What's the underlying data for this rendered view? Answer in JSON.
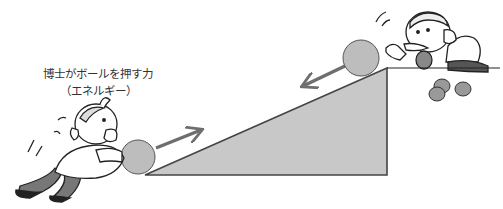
{
  "caption": {
    "line1": "博士がボールを押す力",
    "line2": "（エネルギー）"
  },
  "figure": {
    "slope": {
      "points": "145,175 387,68 387,175",
      "fill": "#c8c8c8",
      "stroke": "#444444"
    },
    "balls": [
      {
        "id": "bottom",
        "cx": 138,
        "cy": 157,
        "r": 17,
        "fill": "#bdbdbd"
      },
      {
        "id": "top",
        "cx": 361,
        "cy": 58,
        "r": 18,
        "fill": "#bdbdbd"
      }
    ],
    "arrows": [
      {
        "id": "push-up",
        "from": [
          156,
          148
        ],
        "to": [
          201,
          130
        ],
        "color": "#6e6e6e"
      },
      {
        "id": "roll-down",
        "from": [
          345,
          66
        ],
        "to": [
          303,
          86
        ],
        "color": "#6e6e6e"
      }
    ],
    "characters": [
      {
        "id": "professor-pushing",
        "description": "professor pushing ball up the slope"
      },
      {
        "id": "professor-top",
        "description": "professor at top of slope releasing ball"
      }
    ]
  }
}
